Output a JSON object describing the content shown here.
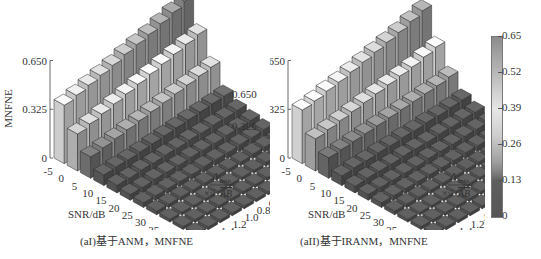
{
  "panels": [
    {
      "id": "a",
      "caption": "(aI)基于ANM，MNFNE",
      "zlabel": "MNFNE",
      "xlabel": "SNR/dB",
      "ylabel_top": "Δ_min",
      "ylabel_bottom": "×√AB"
    },
    {
      "id": "b",
      "caption": "(aII)基于IRANM，MNFNE",
      "zlabel": "MNFNE",
      "xlabel": "SNR/dB",
      "ylabel_top": "Δ_min",
      "ylabel_bottom": "×√AB"
    }
  ],
  "colorbar": {
    "ticks": [
      "0.65",
      "0.52",
      "0.39",
      "0.26",
      "0.13",
      "0"
    ],
    "min": 0,
    "max": 0.65
  },
  "chart_data": [
    {
      "type": "bar3d",
      "title": "(aI)基于ANM，MNFNE",
      "xlabel": "SNR/dB",
      "ylabel": "Δmin×√AB",
      "zlabel": "MNFNE",
      "zlim": [
        0,
        0.65
      ],
      "zticks": [
        0,
        0.325,
        0.65
      ],
      "x": [
        -5,
        0,
        5,
        10,
        15,
        20,
        25,
        30,
        35,
        40,
        45
      ],
      "y": [
        0.1,
        0.2,
        0.3,
        0.4,
        0.5,
        0.6,
        0.8,
        1.0,
        1.2,
        1.4,
        1.6
      ],
      "values": [
        [
          0.95,
          0.68,
          0.42,
          0.2,
          0.13,
          0.1,
          0.08,
          0.05,
          0.04,
          0.03,
          0.03
        ],
        [
          0.9,
          0.65,
          0.4,
          0.19,
          0.12,
          0.09,
          0.07,
          0.05,
          0.04,
          0.03,
          0.03
        ],
        [
          0.86,
          0.62,
          0.38,
          0.18,
          0.12,
          0.09,
          0.07,
          0.05,
          0.04,
          0.03,
          0.03
        ],
        [
          0.82,
          0.59,
          0.36,
          0.17,
          0.11,
          0.08,
          0.06,
          0.04,
          0.03,
          0.03,
          0.03
        ],
        [
          0.79,
          0.56,
          0.34,
          0.16,
          0.11,
          0.08,
          0.06,
          0.04,
          0.03,
          0.03,
          0.03
        ],
        [
          0.76,
          0.53,
          0.32,
          0.15,
          0.1,
          0.08,
          0.06,
          0.04,
          0.03,
          0.03,
          0.03
        ],
        [
          0.72,
          0.5,
          0.3,
          0.14,
          0.1,
          0.07,
          0.05,
          0.04,
          0.03,
          0.03,
          0.03
        ],
        [
          0.69,
          0.47,
          0.28,
          0.13,
          0.09,
          0.07,
          0.05,
          0.04,
          0.03,
          0.03,
          0.03
        ],
        [
          0.66,
          0.44,
          0.26,
          0.12,
          0.09,
          0.07,
          0.05,
          0.04,
          0.03,
          0.03,
          0.03
        ],
        [
          0.63,
          0.41,
          0.24,
          0.12,
          0.08,
          0.06,
          0.05,
          0.04,
          0.03,
          0.03,
          0.03
        ],
        [
          0.6,
          0.38,
          0.22,
          0.11,
          0.08,
          0.06,
          0.05,
          0.04,
          0.03,
          0.03,
          0.03
        ]
      ]
    },
    {
      "type": "bar3d",
      "title": "(aII)基于IRANM，MNFNE",
      "xlabel": "SNR/dB",
      "ylabel": "Δmin×√AB",
      "zlabel": "MNFNE",
      "zlim": [
        0,
        0.65
      ],
      "zticks": [
        0,
        0.325,
        0.65
      ],
      "x": [
        -5,
        0,
        5,
        10,
        15,
        20,
        25,
        30,
        35,
        40,
        45
      ],
      "y": [
        0.1,
        0.2,
        0.3,
        0.4,
        0.5,
        0.6,
        0.8,
        1.0,
        1.2,
        1.4,
        1.6
      ],
      "values": [
        [
          0.85,
          0.55,
          0.32,
          0.16,
          0.11,
          0.08,
          0.06,
          0.05,
          0.04,
          0.03,
          0.03
        ],
        [
          0.81,
          0.52,
          0.3,
          0.15,
          0.11,
          0.08,
          0.06,
          0.05,
          0.04,
          0.03,
          0.03
        ],
        [
          0.77,
          0.49,
          0.29,
          0.14,
          0.1,
          0.08,
          0.06,
          0.04,
          0.04,
          0.03,
          0.03
        ],
        [
          0.74,
          0.47,
          0.28,
          0.14,
          0.1,
          0.07,
          0.06,
          0.04,
          0.03,
          0.03,
          0.03
        ],
        [
          0.71,
          0.45,
          0.27,
          0.13,
          0.09,
          0.07,
          0.05,
          0.04,
          0.03,
          0.03,
          0.03
        ],
        [
          0.68,
          0.43,
          0.26,
          0.13,
          0.09,
          0.07,
          0.05,
          0.04,
          0.03,
          0.03,
          0.03
        ],
        [
          0.65,
          0.41,
          0.25,
          0.12,
          0.09,
          0.06,
          0.05,
          0.04,
          0.03,
          0.03,
          0.03
        ],
        [
          0.62,
          0.39,
          0.24,
          0.12,
          0.08,
          0.06,
          0.05,
          0.04,
          0.03,
          0.03,
          0.03
        ],
        [
          0.6,
          0.37,
          0.23,
          0.11,
          0.08,
          0.06,
          0.05,
          0.04,
          0.03,
          0.03,
          0.03
        ],
        [
          0.57,
          0.35,
          0.22,
          0.11,
          0.08,
          0.06,
          0.05,
          0.04,
          0.03,
          0.03,
          0.03
        ],
        [
          0.55,
          0.33,
          0.21,
          0.1,
          0.07,
          0.06,
          0.05,
          0.04,
          0.03,
          0.03,
          0.03
        ]
      ]
    }
  ]
}
